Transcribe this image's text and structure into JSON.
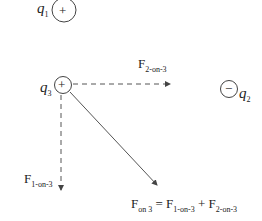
{
  "charges": [
    {
      "id": "q1",
      "symbol": "q",
      "index": "1",
      "sign": "+"
    },
    {
      "id": "q2",
      "symbol": "q",
      "index": "2",
      "sign": "−"
    },
    {
      "id": "q3",
      "symbol": "q",
      "index": "3",
      "sign": "+"
    }
  ],
  "forces": {
    "f2on3": {
      "main": "F",
      "sub": "2-on-3"
    },
    "f1on3": {
      "main": "F",
      "sub": "1-on-3"
    },
    "net": {
      "main": "F",
      "sub": "on 3",
      "eq": "=",
      "t1": "F",
      "t1sub": "1-on-3",
      "plus": "+",
      "t2": "F",
      "t2sub": "2-on-3"
    }
  }
}
